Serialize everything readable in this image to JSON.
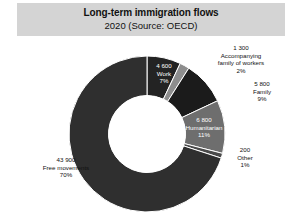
{
  "header": {
    "title": "Long-term immigration flows",
    "subtitle": "2020 (Source: OECD)"
  },
  "chart_data": {
    "type": "pie",
    "variant": "donut",
    "title": "Long-term immigration flows",
    "subtitle": "2020 (Source: OECD)",
    "source": "OECD",
    "year": "2020",
    "total": 62600,
    "units": "persons",
    "legend": "none",
    "grid": false,
    "start_angle_deg": 0,
    "direction": "clockwise",
    "inner_radius_ratio": 0.49,
    "categories": [
      "Work",
      "Accompanying family of workers",
      "Family",
      "Humanitarian",
      "Other",
      "Free movements"
    ],
    "values": [
      4600,
      1300,
      5800,
      6800,
      200,
      43900
    ],
    "percents": [
      7,
      2,
      9,
      11,
      1,
      70
    ],
    "slices": [
      {
        "name": "Work",
        "value_label": "4 600",
        "category_label": "Work",
        "percent_label": "7%",
        "value": 4600,
        "percent": 7,
        "color": "#232323",
        "label_placement": "inside"
      },
      {
        "name": "Accompanying family of workers",
        "value_label": "1 300",
        "category_label": "Accompanying family of workers",
        "category_label_line1": "Accompanying",
        "category_label_line2": "family of workers",
        "percent_label": "2%",
        "value": 1300,
        "percent": 2,
        "color": "#8d8d8d",
        "label_placement": "outside"
      },
      {
        "name": "Family",
        "value_label": "5 800",
        "category_label": "Family",
        "percent_label": "9%",
        "value": 5800,
        "percent": 9,
        "color": "#1b1b1b",
        "label_placement": "outside"
      },
      {
        "name": "Humanitarian",
        "value_label": "6 800",
        "category_label": "Humanitarian",
        "percent_label": "11%",
        "value": 6800,
        "percent": 11,
        "color": "#6e6e6e",
        "label_placement": "inside"
      },
      {
        "name": "Other",
        "value_label": "200",
        "category_label": "Other",
        "percent_label": "1%",
        "value": 200,
        "percent": 1,
        "color": "#4a4a4a",
        "label_placement": "outside"
      },
      {
        "name": "Free movements",
        "value_label": "43 900",
        "category_label": "Free movements",
        "percent_label": "70%",
        "value": 43900,
        "percent": 70,
        "color": "#2f2f2f",
        "label_placement": "outside"
      }
    ],
    "colors": {
      "title_band": "#d4d4d4",
      "background": "#ffffff",
      "hole": "#ffffff",
      "separator": "#ffffff",
      "text": "#111111",
      "text_inverse": "#ffffff"
    }
  }
}
